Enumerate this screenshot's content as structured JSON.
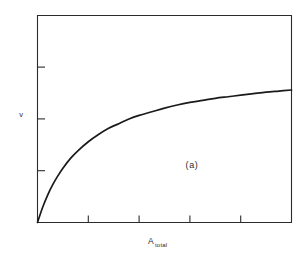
{
  "figure": {
    "background_color": "#ffffff",
    "line_color": "#1a1a1a",
    "axis_color": "#2b2b2b",
    "panel_label": "(a)",
    "y_axis_label": "v",
    "x_axis_label_main": "A",
    "x_axis_label_sub": "total"
  },
  "chart_data": {
    "type": "line",
    "title": "",
    "subtitle": "",
    "xlabel": "A_total",
    "ylabel": "v",
    "annotations": [
      {
        "text": "(a)",
        "x": 0.61,
        "y": 0.28
      }
    ],
    "grid": false,
    "legend": null,
    "xlim": [
      0,
      5
    ],
    "ylim": [
      0,
      4
    ],
    "xticks": [
      1,
      2,
      3,
      4
    ],
    "yticks": [
      1,
      2,
      3
    ],
    "xticklabels": [
      "",
      "",
      "",
      ""
    ],
    "yticklabels": [
      "",
      "",
      ""
    ],
    "tick_direction": "in",
    "series": [
      {
        "name": "v vs A_total",
        "model": "v = Vmax * x / (K + x)",
        "Vmax": 3.05,
        "K": 0.95,
        "x": [
          0.0,
          0.1,
          0.2,
          0.3,
          0.4,
          0.5,
          0.65,
          0.8,
          1.0,
          1.2,
          1.4,
          1.6,
          1.8,
          2.0,
          2.25,
          2.5,
          2.75,
          3.0,
          3.25,
          3.5,
          3.75,
          4.0,
          4.25,
          4.5,
          4.75,
          5.0
        ],
        "values": [
          0.0,
          0.29,
          0.53,
          0.73,
          0.9,
          1.05,
          1.24,
          1.39,
          1.56,
          1.7,
          1.82,
          1.91,
          2.0,
          2.07,
          2.14,
          2.21,
          2.27,
          2.32,
          2.36,
          2.4,
          2.43,
          2.46,
          2.49,
          2.52,
          2.54,
          2.56
        ]
      }
    ]
  }
}
